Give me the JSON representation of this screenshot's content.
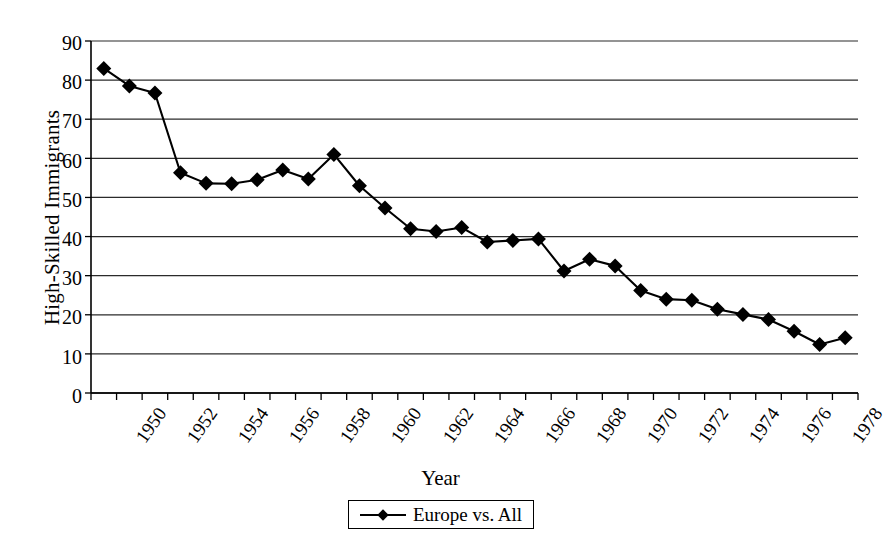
{
  "chart_data": {
    "type": "line",
    "title": "",
    "xlabel": "Year",
    "ylabel": "High-Skilled Immigrants",
    "xlim": [
      1949.5,
      1979.5
    ],
    "ylim": [
      0,
      90
    ],
    "y_ticks": [
      0,
      10,
      20,
      30,
      40,
      50,
      60,
      70,
      80,
      90
    ],
    "x_tick_labels": [
      "1950",
      "1952",
      "1954",
      "1956",
      "1958",
      "1960",
      "1962",
      "1964",
      "1966",
      "1968",
      "1970",
      "1972",
      "1974",
      "1976",
      "1978"
    ],
    "grid": "horizontal",
    "legend_position": "bottom-center",
    "marker": "diamond",
    "line_color": "#000000",
    "marker_color": "#000000",
    "series": [
      {
        "name": "Europe vs. All",
        "x": [
          1950,
          1951,
          1952,
          1953,
          1954,
          1955,
          1956,
          1957,
          1958,
          1959,
          1960,
          1961,
          1962,
          1963,
          1964,
          1965,
          1966,
          1967,
          1968,
          1969,
          1970,
          1971,
          1972,
          1973,
          1974,
          1975,
          1976,
          1977,
          1978,
          1979
        ],
        "values": [
          83,
          78.5,
          76.7,
          56.3,
          53.6,
          53.5,
          54.5,
          57,
          54.7,
          61,
          53,
          47.3,
          42,
          41.3,
          42.3,
          38.6,
          39,
          39.4,
          31.2,
          34.2,
          32.5,
          26.2,
          24,
          23.7,
          21.4,
          20.1,
          18.8,
          15.8,
          12.4,
          14.1
        ]
      }
    ]
  },
  "legend": {
    "entries": [
      {
        "label": "Europe vs. All"
      }
    ]
  },
  "axes": {
    "y_title": "High-Skilled Immigrants",
    "x_title": "Year"
  }
}
